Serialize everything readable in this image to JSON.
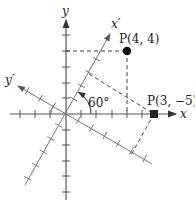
{
  "diagram": {
    "axes": {
      "x_label": "x",
      "y_label": "y",
      "x_prime_label": "x′",
      "y_prime_label": "y′"
    },
    "angle_label": "60°",
    "rotation_degrees": 60,
    "points": [
      {
        "label": "P(4, 4)",
        "frame": "xy",
        "x": 4,
        "y": 4,
        "marker": "circle"
      },
      {
        "label": "P(3, −5)",
        "frame": "x′y′",
        "x": 3,
        "y": -5,
        "marker": "square"
      }
    ],
    "colors": {
      "axis": "#555555",
      "rotated_axis": "#777777",
      "dash": "#444444",
      "point": "#111111"
    }
  }
}
